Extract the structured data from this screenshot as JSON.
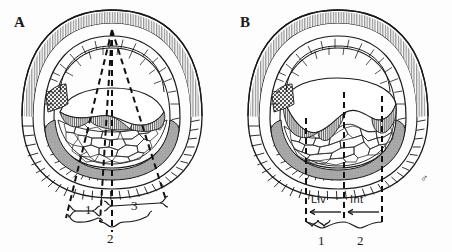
{
  "figure": {
    "background_color": "#fdfdfd",
    "ink_color": "#1a1a1a",
    "shaded_band_color": "#a8a8a8",
    "stipple_patch_color": "#4a4a4a",
    "hatch_color": "#555555"
  },
  "panels": [
    {
      "id": "A",
      "letter": "A",
      "brackets": [
        {
          "id": "bracket-1",
          "label": "1"
        },
        {
          "id": "bracket-3",
          "label": "3"
        },
        {
          "id": "bracket-2",
          "label": "2"
        }
      ]
    },
    {
      "id": "B",
      "letter": "B",
      "region_labels": [
        {
          "id": "region-liv",
          "label": "Liv",
          "arrow": "left"
        },
        {
          "id": "region-int",
          "label": "Int",
          "arrow": "left"
        }
      ],
      "brackets": [
        {
          "id": "bracket-1",
          "label": "1"
        },
        {
          "id": "bracket-2",
          "label": "2"
        }
      ],
      "sex_symbol": "♂"
    }
  ]
}
